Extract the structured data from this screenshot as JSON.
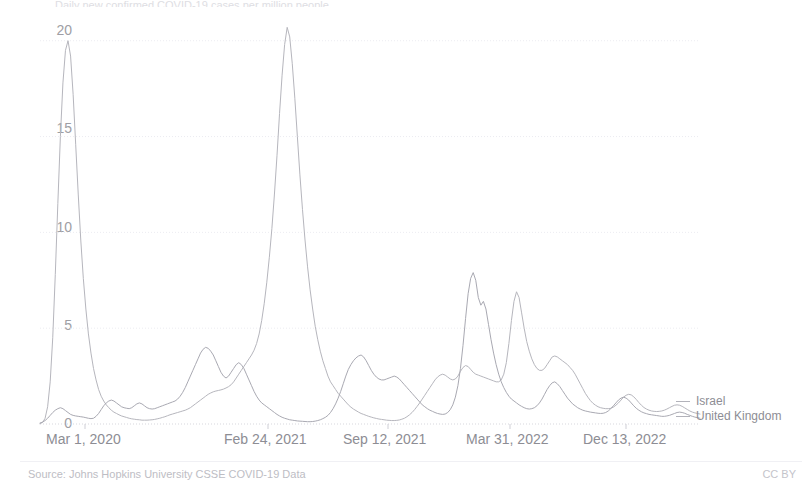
{
  "chart_data": {
    "type": "line",
    "title": "",
    "cropped_top_text": "Daily new confirmed COVID-19 cases per million people",
    "xlabel": "",
    "ylabel": "",
    "ylim": [
      0,
      21.5
    ],
    "yticks": [
      0,
      5,
      10,
      15,
      20
    ],
    "ytick_labels": [
      "0",
      "5",
      "10",
      "15",
      "20"
    ],
    "grid": true,
    "legend_position": "right",
    "xtick_labels": [
      "Mar 1, 2020",
      "Feb 24, 2021",
      "Sep 12, 2021",
      "Mar 31, 2022",
      "Dec 13, 2022"
    ],
    "xtick_positions_px": [
      85,
      268,
      388,
      510,
      626
    ],
    "x_range": [
      "Mar 1, 2020",
      "Feb 28, 2023"
    ],
    "series": [
      {
        "name": "Israel",
        "color": "#a9a9b2",
        "peak_value": 8.0,
        "peak_date": "Jan 2022",
        "values": [
          0.05,
          0.1,
          0.18,
          0.3,
          0.45,
          0.6,
          0.72,
          0.8,
          0.85,
          0.8,
          0.7,
          0.6,
          0.5,
          0.45,
          0.42,
          0.4,
          0.38,
          0.36,
          0.33,
          0.3,
          0.28,
          0.3,
          0.4,
          0.55,
          0.75,
          0.95,
          1.1,
          1.2,
          1.25,
          1.2,
          1.1,
          1.0,
          0.9,
          0.85,
          0.82,
          0.8,
          0.85,
          0.95,
          1.05,
          1.1,
          1.05,
          0.95,
          0.85,
          0.8,
          0.78,
          0.8,
          0.85,
          0.9,
          0.95,
          1.0,
          1.05,
          1.1,
          1.15,
          1.2,
          1.3,
          1.45,
          1.65,
          1.9,
          2.2,
          2.5,
          2.8,
          3.1,
          3.4,
          3.7,
          3.9,
          4.0,
          3.95,
          3.8,
          3.6,
          3.3,
          3.0,
          2.7,
          2.5,
          2.4,
          2.5,
          2.7,
          2.9,
          3.1,
          3.2,
          3.1,
          2.9,
          2.6,
          2.3,
          2.0,
          1.7,
          1.45,
          1.25,
          1.1,
          1.0,
          0.9,
          0.8,
          0.7,
          0.6,
          0.5,
          0.42,
          0.35,
          0.3,
          0.26,
          0.22,
          0.2,
          0.18,
          0.16,
          0.15,
          0.14,
          0.13,
          0.12,
          0.12,
          0.13,
          0.15,
          0.18,
          0.22,
          0.28,
          0.35,
          0.45,
          0.6,
          0.8,
          1.05,
          1.35,
          1.7,
          2.1,
          2.5,
          2.85,
          3.1,
          3.3,
          3.45,
          3.55,
          3.6,
          3.5,
          3.3,
          3.05,
          2.8,
          2.6,
          2.45,
          2.35,
          2.3,
          2.3,
          2.35,
          2.4,
          2.45,
          2.5,
          2.45,
          2.35,
          2.2,
          2.05,
          1.9,
          1.75,
          1.6,
          1.45,
          1.3,
          1.15,
          1.0,
          0.9,
          0.8,
          0.72,
          0.66,
          0.6,
          0.55,
          0.52,
          0.5,
          0.52,
          0.6,
          0.75,
          1.0,
          1.4,
          2.0,
          2.9,
          4.1,
          5.5,
          6.8,
          7.6,
          7.9,
          7.5,
          6.6,
          6.2,
          6.4,
          6.0,
          5.2,
          4.4,
          3.7,
          3.1,
          2.6,
          2.2,
          1.9,
          1.65,
          1.45,
          1.3,
          1.2,
          1.1,
          1.0,
          0.92,
          0.85,
          0.8,
          0.78,
          0.8,
          0.85,
          0.95,
          1.1,
          1.3,
          1.55,
          1.8,
          2.0,
          2.15,
          2.2,
          2.1,
          1.95,
          1.75,
          1.55,
          1.35,
          1.2,
          1.05,
          0.95,
          0.85,
          0.78,
          0.72,
          0.68,
          0.65,
          0.62,
          0.6,
          0.58,
          0.56,
          0.55,
          0.56,
          0.6,
          0.68,
          0.8,
          0.95,
          1.1,
          1.25,
          1.35,
          1.4,
          1.35,
          1.25,
          1.1,
          0.95,
          0.82,
          0.72,
          0.64,
          0.58,
          0.54,
          0.5,
          0.48,
          0.46,
          0.44,
          0.42,
          0.4,
          0.4,
          0.42,
          0.45,
          0.5,
          0.55,
          0.6,
          0.62,
          0.6,
          0.56,
          0.5,
          0.45,
          0.4,
          0.36,
          0.33,
          0.3
        ]
      },
      {
        "name": "United Kingdom",
        "color": "#b6b6bd",
        "peak_value": 20.7,
        "peak_date": "Jan 2021",
        "values": [
          0.02,
          0.08,
          0.3,
          0.9,
          2.2,
          4.5,
          7.8,
          11.5,
          15.0,
          17.8,
          19.5,
          20.0,
          19.2,
          17.2,
          14.6,
          12.0,
          9.6,
          7.6,
          6.0,
          4.7,
          3.7,
          2.9,
          2.3,
          1.8,
          1.45,
          1.2,
          1.0,
          0.85,
          0.72,
          0.62,
          0.55,
          0.48,
          0.42,
          0.38,
          0.34,
          0.3,
          0.27,
          0.25,
          0.23,
          0.22,
          0.2,
          0.2,
          0.2,
          0.21,
          0.22,
          0.24,
          0.27,
          0.3,
          0.34,
          0.38,
          0.43,
          0.48,
          0.52,
          0.56,
          0.6,
          0.64,
          0.68,
          0.72,
          0.78,
          0.85,
          0.95,
          1.05,
          1.15,
          1.25,
          1.35,
          1.45,
          1.55,
          1.62,
          1.68,
          1.72,
          1.75,
          1.78,
          1.82,
          1.88,
          1.95,
          2.05,
          2.2,
          2.4,
          2.6,
          2.8,
          3.0,
          3.2,
          3.4,
          3.6,
          3.85,
          4.2,
          4.7,
          5.4,
          6.3,
          7.4,
          8.7,
          10.2,
          12.0,
          14.0,
          16.2,
          18.2,
          19.8,
          20.7,
          20.2,
          18.8,
          17.0,
          15.0,
          13.0,
          11.2,
          9.6,
          8.2,
          7.0,
          6.0,
          5.1,
          4.4,
          3.8,
          3.3,
          2.9,
          2.5,
          2.2,
          2.0,
          1.8,
          1.6,
          1.45,
          1.3,
          1.15,
          1.0,
          0.88,
          0.78,
          0.7,
          0.62,
          0.55,
          0.5,
          0.45,
          0.4,
          0.36,
          0.32,
          0.29,
          0.26,
          0.24,
          0.22,
          0.2,
          0.19,
          0.18,
          0.18,
          0.19,
          0.21,
          0.25,
          0.3,
          0.38,
          0.48,
          0.6,
          0.75,
          0.92,
          1.1,
          1.3,
          1.5,
          1.7,
          1.9,
          2.1,
          2.3,
          2.45,
          2.55,
          2.6,
          2.55,
          2.45,
          2.35,
          2.3,
          2.35,
          2.5,
          2.75,
          2.95,
          3.05,
          3.0,
          2.85,
          2.7,
          2.6,
          2.55,
          2.5,
          2.45,
          2.4,
          2.35,
          2.3,
          2.25,
          2.2,
          2.2,
          2.3,
          2.6,
          3.2,
          4.2,
          5.4,
          6.4,
          6.9,
          6.6,
          5.8,
          5.0,
          4.3,
          3.8,
          3.4,
          3.1,
          2.9,
          2.8,
          2.8,
          2.9,
          3.1,
          3.3,
          3.5,
          3.55,
          3.5,
          3.4,
          3.3,
          3.2,
          3.1,
          2.95,
          2.8,
          2.6,
          2.35,
          2.1,
          1.85,
          1.6,
          1.4,
          1.22,
          1.08,
          0.98,
          0.9,
          0.85,
          0.82,
          0.8,
          0.8,
          0.82,
          0.88,
          0.98,
          1.1,
          1.25,
          1.4,
          1.5,
          1.55,
          1.52,
          1.42,
          1.28,
          1.12,
          0.98,
          0.86,
          0.78,
          0.72,
          0.68,
          0.66,
          0.65,
          0.66,
          0.68,
          0.72,
          0.78,
          0.85,
          0.92,
          0.98,
          1.0,
          0.98,
          0.92,
          0.84,
          0.76,
          0.68,
          0.62,
          0.58,
          0.55,
          0.52
        ]
      }
    ]
  },
  "axis": {
    "y_labels": [
      "20",
      "15",
      "10",
      "5",
      "0"
    ],
    "x_labels": [
      "Mar 1, 2020",
      "Feb 24, 2021",
      "Sep 12, 2021",
      "Mar 31, 2022",
      "Dec 13, 2022"
    ]
  },
  "legend": {
    "items": [
      {
        "label": "Israel"
      },
      {
        "label": "United Kingdom"
      }
    ]
  },
  "footer": {
    "source": "Source: Johns Hopkins University CSSE COVID-19 Data",
    "license": "CC BY"
  },
  "colors": {
    "israel": "#a9a9b2",
    "uk": "#b6b6bd",
    "grid": "#ececf1",
    "text": "#8d8d94",
    "background": "#ffffff"
  }
}
